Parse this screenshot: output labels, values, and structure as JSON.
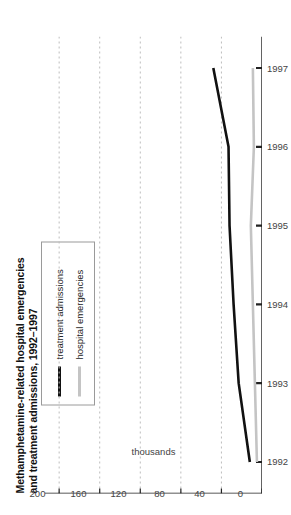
{
  "chart_data": {
    "type": "line",
    "title": "Methamphetamine-related hospital emergencies and treatment admissions, 1992–1997",
    "title_line1": "Methamphetamine-related hospital emergencies",
    "title_line2": "and treatment admissions, 1992–1997",
    "orientation": "rotated-90-ccw",
    "xlabel": "",
    "ylabel": "thousands",
    "categories": [
      1992,
      1993,
      1994,
      1995,
      1996,
      1997
    ],
    "xtick_labels": [
      "1992",
      "1993",
      "1994",
      "1995",
      "1996",
      "1997"
    ],
    "ytick_labels": [
      "0",
      "40",
      "80",
      "120",
      "160",
      "200"
    ],
    "ytick_values": [
      0,
      40,
      80,
      120,
      160,
      200
    ],
    "ylim": [
      0,
      210
    ],
    "xlim": [
      1991.6,
      1997.4
    ],
    "grid": "y-axis dashed gridlines only",
    "legend_position": "top-left inside box",
    "series": [
      {
        "name": "treatment admissions",
        "color": "#111111",
        "width": 2.6,
        "values": [
          12,
          23,
          28,
          32,
          33,
          48
        ]
      },
      {
        "name": "hospital emergencies",
        "color": "#c4c4c4",
        "width": 2.6,
        "values": [
          5,
          7,
          9,
          11,
          8,
          9
        ]
      }
    ]
  },
  "axes": {
    "axis_color": "#222222",
    "grid_color": "#bdbdbd",
    "tick_color": "#444444"
  },
  "legend": {
    "items": [
      {
        "label": "treatment admissions",
        "color": "#111111"
      },
      {
        "label": "hospital emergencies",
        "color": "#c4c4c4"
      }
    ]
  }
}
